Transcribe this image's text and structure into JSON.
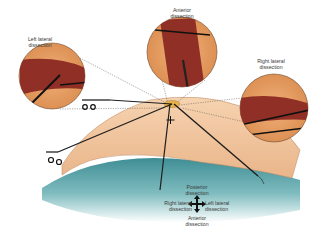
{
  "figure": {
    "colors": {
      "skin": "#f2c9a2",
      "skin_shadow": "#e2a877",
      "drape_teal": "#4f9aa0",
      "drape_light": "#a9d3d4",
      "tissue_red": "#8f2f25",
      "tissue_orange": "#d98a4c",
      "instrument": "#1e1e1e",
      "dotted_line": "#555555"
    }
  },
  "insets": [
    {
      "id": "left-lateral",
      "label": "Left lateral\ndissection"
    },
    {
      "id": "anterior",
      "label": "Anterior\ndissection"
    },
    {
      "id": "right-lateral",
      "label": "Right lateral\ndissection"
    }
  ],
  "compass": {
    "top": "Posterior\ndissection",
    "left": "Right lateral\ndissection",
    "right": "Left lateral\ndissection",
    "bottom": "Anterior\ndissection"
  }
}
